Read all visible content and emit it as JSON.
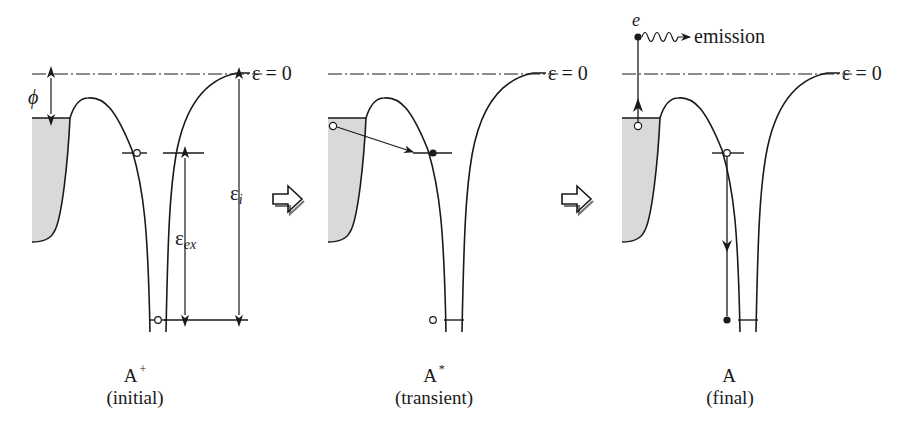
{
  "panels": [
    {
      "id": "initial",
      "state_label": "A",
      "state_superscript": "+",
      "caption": "(initial)",
      "annotations": {
        "zero_level": "ε = 0",
        "work_function": "ϕ",
        "ionization_energy": "ε",
        "ionization_sub": "i",
        "excitation_energy": "ε",
        "excitation_sub": "ex"
      }
    },
    {
      "id": "transient",
      "state_label": "A",
      "state_superscript": "*",
      "caption": "(transient)",
      "annotations": {
        "zero_level": "ε = 0"
      }
    },
    {
      "id": "final",
      "state_label": "A",
      "state_superscript": "",
      "caption": "(final)",
      "annotations": {
        "zero_level": "ε = 0",
        "electron": "e",
        "emission": "emission"
      }
    }
  ],
  "transition_arrows": [
    "right-arrow",
    "right-arrow"
  ],
  "colors": {
    "line": "#1a1a1a",
    "metal_fill": "#d9d9d9"
  }
}
